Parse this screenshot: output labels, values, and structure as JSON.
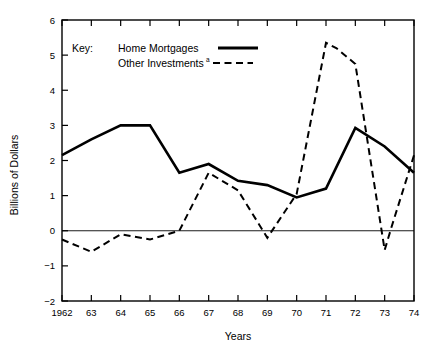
{
  "chart_data": {
    "type": "line",
    "title": "",
    "xlabel": "Years",
    "ylabel": "Billions of Dollars",
    "categories": [
      "1962",
      "63",
      "64",
      "65",
      "66",
      "67",
      "68",
      "69",
      "70",
      "71",
      "72",
      "73",
      "74"
    ],
    "x": [
      1962,
      1963,
      1964,
      1965,
      1966,
      1967,
      1968,
      1969,
      1970,
      1971,
      1972,
      1973,
      1974
    ],
    "xlim": [
      1962,
      1974
    ],
    "ylim": [
      -2,
      6
    ],
    "yticks": [
      -2,
      -1,
      0,
      1,
      2,
      3,
      4,
      5,
      6
    ],
    "ytick_labels": [
      "-2",
      "-1",
      "0",
      "1",
      "2",
      "3",
      "4",
      "5",
      "6"
    ],
    "grid": false,
    "zero_line": true,
    "legend_position": "upper-left",
    "series": [
      {
        "name": "Home Mortgages",
        "style": "solid",
        "color": "#000000",
        "values": [
          2.15,
          2.6,
          3.0,
          3.0,
          1.65,
          1.9,
          1.42,
          1.3,
          0.95,
          1.2,
          2.93,
          2.4,
          1.65
        ]
      },
      {
        "name": "Other Investments",
        "style": "dashed",
        "color": "#000000",
        "footnote": "a",
        "values": [
          -0.25,
          -0.6,
          -0.1,
          -0.25,
          0.0,
          1.65,
          1.15,
          -0.2,
          1.05,
          5.35,
          4.75,
          -0.55,
          2.15
        ]
      }
    ],
    "extra_vertices": {
      "Other Investments": [
        {
          "x": 1971.35,
          "y": 5.2
        },
        {
          "x": 1973.25,
          "y": 0.15
        }
      ]
    }
  },
  "legend": {
    "key_label": "Key:",
    "entries": [
      {
        "label": "Home Mortgages",
        "style": "solid",
        "footnote": ""
      },
      {
        "label": "Other Investments",
        "style": "dashed",
        "footnote": "a"
      }
    ]
  },
  "axes": {
    "y_title": "Billions of Dollars",
    "x_title": "Years",
    "y_labels": [
      "6",
      "5",
      "4",
      "3",
      "2",
      "1",
      "0",
      "-1",
      "-2"
    ],
    "x_labels": [
      "1962",
      "63",
      "64",
      "65",
      "66",
      "67",
      "68",
      "69",
      "70",
      "71",
      "72",
      "73",
      "74"
    ]
  },
  "colors": {
    "background": "#ffffff",
    "ink": "#000000"
  }
}
